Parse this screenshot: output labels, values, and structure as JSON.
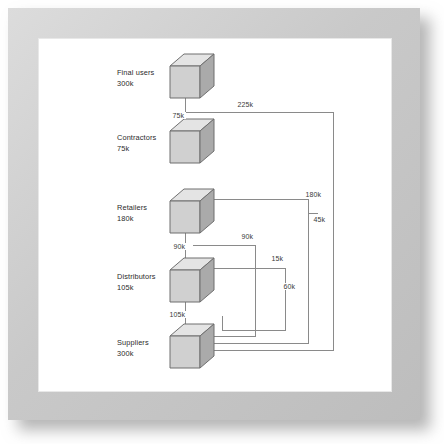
{
  "diagram": {
    "type": "flow-network",
    "colors": {
      "frame": "#cccccc",
      "panel": "#ffffff",
      "cube_top": "#e2e2e2",
      "cube_front": "#d0d0d0",
      "cube_side": "#a8a8a8",
      "cube_edge": "#6f6f6f",
      "flow_line": "#8a8a8a",
      "text": "#2b2b2b"
    },
    "nodes": [
      {
        "id": "final-users",
        "name": "Final users",
        "value": "300k",
        "cx": 192,
        "cy": 78
      },
      {
        "id": "contractors",
        "name": "Contractors",
        "value": "75k",
        "cx": 192,
        "cy": 143
      },
      {
        "id": "retailers",
        "name": "Retailers",
        "value": "180k",
        "cx": 192,
        "cy": 213
      },
      {
        "id": "distributors",
        "name": "Distributors",
        "value": "105k",
        "cx": 192,
        "cy": 282
      },
      {
        "id": "suppliers",
        "name": "Suppliers",
        "value": "300k",
        "cx": 192,
        "cy": 348
      }
    ],
    "flows": [
      {
        "id": "f-75k",
        "label": "75k",
        "from": "final-users",
        "to": "contractors",
        "lx": 171,
        "ly": 117
      },
      {
        "id": "f-225k",
        "label": "225k",
        "from": "final-users",
        "to": "suppliers",
        "lx": 236,
        "ly": 106
      },
      {
        "id": "f-180k",
        "label": "180k",
        "from": "retailers",
        "to": "suppliers",
        "lx": 304,
        "ly": 196
      },
      {
        "id": "f-45k",
        "label": "45k",
        "from": "retailers",
        "to": "suppliers",
        "lx": 312,
        "ly": 221
      },
      {
        "id": "f-90k-v",
        "label": "90k",
        "from": "retailers",
        "to": "distributors",
        "lx": 172,
        "ly": 248
      },
      {
        "id": "f-90k-h",
        "label": "90k",
        "from": "retailers",
        "to": "suppliers",
        "lx": 240,
        "ly": 238
      },
      {
        "id": "f-15k",
        "label": "15k",
        "from": "distributors",
        "to": "suppliers",
        "lx": 270,
        "ly": 260
      },
      {
        "id": "f-60k",
        "label": "60k",
        "from": "distributors",
        "to": "suppliers",
        "lx": 282,
        "ly": 288
      },
      {
        "id": "f-105k",
        "label": "105k",
        "from": "distributors",
        "to": "suppliers",
        "lx": 170,
        "ly": 316
      }
    ]
  }
}
